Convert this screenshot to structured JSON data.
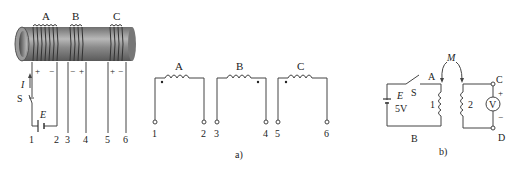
{
  "figure_left": {
    "coil_labels": [
      "A",
      "B",
      "C"
    ],
    "polarities": {
      "A": [
        "+",
        "−"
      ],
      "B": [
        "−",
        "+"
      ],
      "C": [
        "+",
        "−"
      ]
    },
    "terminal_numbers": [
      "1",
      "2",
      "3",
      "4",
      "5",
      "6"
    ],
    "current_label": "I",
    "switch_label": "S",
    "source_label": "E"
  },
  "figure_a": {
    "coil_labels": [
      "A",
      "B",
      "C"
    ],
    "terminal_numbers": [
      "1",
      "2",
      "3",
      "4",
      "5",
      "6"
    ],
    "caption": "a)"
  },
  "figure_b": {
    "mutual_label": "M",
    "node_labels": {
      "A": "A",
      "B": "B",
      "C": "C",
      "D": "D"
    },
    "switch_label": "S",
    "source_label": "E",
    "source_value": "5V",
    "coil1_label": "1",
    "coil2_label": "2",
    "voltmeter_label": "V",
    "plus": "+",
    "minus": "−",
    "caption": "b)"
  }
}
